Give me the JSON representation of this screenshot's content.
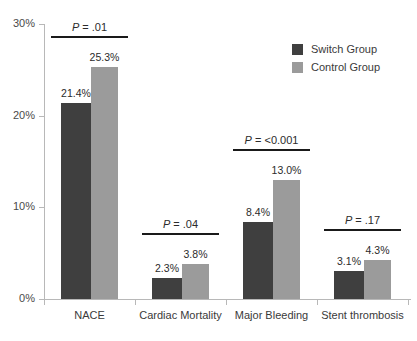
{
  "chart_data": {
    "type": "bar",
    "title": "",
    "subtitle": "",
    "xlabel": "",
    "ylabel": "",
    "ylim": [
      0,
      30
    ],
    "ytick_labels": [
      "0%",
      "10%",
      "20%",
      "30%"
    ],
    "ytick_values": [
      0,
      10,
      20,
      30
    ],
    "grid": false,
    "legend_position": "top-right",
    "categories": [
      "NACE",
      "Cardiac Mortality",
      "Major Bleeding",
      "Stent thrombosis"
    ],
    "series": [
      {
        "name": "Switch Group",
        "color": "#3f3f3f",
        "values": [
          21.4,
          2.3,
          8.4,
          3.1
        ],
        "data_labels": [
          "21.4%",
          "2.3%",
          "8.4%",
          "3.1%"
        ]
      },
      {
        "name": "Control Group",
        "color": "#9b9b9b",
        "values": [
          25.3,
          3.8,
          13.0,
          4.3
        ],
        "data_labels": [
          "25.3%",
          "3.8%",
          "13.0%",
          "4.3%"
        ]
      }
    ],
    "annotations": [
      {
        "category": "NACE",
        "prefix": "P",
        "text": " = .01",
        "label": "P = .01"
      },
      {
        "category": "Cardiac Mortality",
        "prefix": "P",
        "text": " = .04",
        "label": "P = .04"
      },
      {
        "category": "Major Bleeding",
        "prefix": "P",
        "text": " = <0.001",
        "label": "P = <0.001"
      },
      {
        "category": "Stent thrombosis",
        "prefix": "P",
        "text": " = .17",
        "label": "P = .17"
      }
    ]
  },
  "legend": {
    "items": [
      {
        "label": "Switch Group",
        "color": "#3f3f3f"
      },
      {
        "label": "Control Group",
        "color": "#9b9b9b"
      }
    ]
  },
  "colors": {
    "switch_group": "#3f3f3f",
    "control_group": "#9b9b9b",
    "axis": "#b8b8b8",
    "annotation_rule": "#1a1a1a",
    "background": "#ffffff"
  }
}
